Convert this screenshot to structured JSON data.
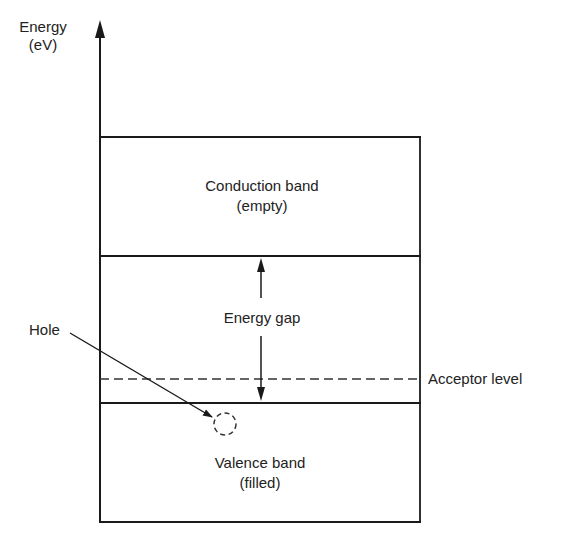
{
  "diagram": {
    "type": "energy-band-diagram",
    "axis": {
      "label_line1": "Energy",
      "label_line2": "(eV)"
    },
    "bands": {
      "conduction": {
        "line1": "Conduction band",
        "line2": "(empty)"
      },
      "gap": {
        "label": "Energy gap"
      },
      "valence": {
        "line1": "Valence band",
        "line2": "(filled)"
      }
    },
    "levels": {
      "acceptor": {
        "label": "Acceptor level",
        "style": "dashed"
      }
    },
    "annotations": {
      "hole": {
        "label": "Hole"
      }
    },
    "colors": {
      "line": "#1a1a1a",
      "background": "#ffffff"
    }
  }
}
